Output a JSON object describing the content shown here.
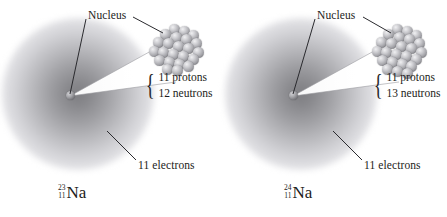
{
  "figure": {
    "background_color": "#ffffff",
    "cloud_color_center": "#7d7d81",
    "nucleon_color": "#a3a3a8",
    "line_color": "#2a2a2e"
  },
  "panels": [
    {
      "id": "sodium-23",
      "nucleus_label": "Nucleus",
      "electrons_label": "11 electrons",
      "brace": "{",
      "particles": [
        "11 protons",
        "12 neutrons"
      ],
      "isotope": {
        "mass_number": "23",
        "atomic_number": "11",
        "symbol": "Na"
      },
      "nucleon_count": 23
    },
    {
      "id": "sodium-24",
      "nucleus_label": "Nucleus",
      "electrons_label": "11 electrons",
      "brace": "{",
      "particles": [
        "11 protons",
        "13 neutrons"
      ],
      "isotope": {
        "mass_number": "24",
        "atomic_number": "11",
        "symbol": "Na"
      },
      "nucleon_count": 24
    }
  ]
}
